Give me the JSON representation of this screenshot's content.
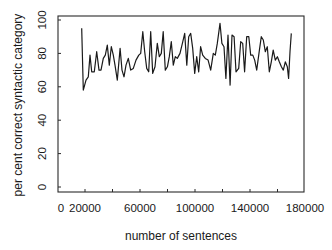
{
  "chart_data": {
    "type": "line",
    "title": "",
    "xlabel": "number of sentences",
    "ylabel": "per cent correct syntactic category",
    "xlim": [
      0,
      180000
    ],
    "ylim": [
      0,
      100
    ],
    "x_ticks": [
      0,
      20000,
      40000,
      60000,
      80000,
      100000,
      120000,
      140000,
      160000,
      180000
    ],
    "x_tick_labels": [
      "0",
      "20000",
      "60000",
      "100000",
      "140000",
      "180000"
    ],
    "x_tick_label_values": [
      0,
      20000,
      60000,
      100000,
      140000,
      180000
    ],
    "y_ticks": [
      0,
      20,
      40,
      60,
      80,
      100
    ],
    "y_tick_labels": [
      "0",
      "20",
      "40",
      "60",
      "80",
      "100"
    ],
    "grid": false,
    "legend": null,
    "line_color": "#1a1a1a",
    "series": [
      {
        "name": "per cent correct",
        "x": [
          17600,
          18800,
          20700,
          22400,
          23600,
          24900,
          26800,
          28500,
          30200,
          31600,
          33300,
          34800,
          36200,
          37700,
          39100,
          40600,
          41800,
          43500,
          45500,
          46900,
          48400,
          49800,
          51500,
          53200,
          55100,
          57100,
          59100,
          60500,
          62000,
          63400,
          64900,
          66300,
          67800,
          69200,
          70900,
          72600,
          74000,
          75500,
          76900,
          78400,
          79900,
          81300,
          82800,
          84200,
          85700,
          87100,
          89100,
          91100,
          92500,
          94000,
          95400,
          96900,
          98300,
          99800,
          101200,
          102700,
          104100,
          105600,
          107500,
          109500,
          111400,
          113300,
          114800,
          116200,
          118200,
          119600,
          121100,
          122500,
          124000,
          125500,
          126900,
          128400,
          129800,
          131800,
          133200,
          134700,
          136100,
          137600,
          139100,
          140500,
          142000,
          143400,
          144900,
          146800,
          148200,
          149700,
          151100,
          152600,
          154000,
          155500,
          156900,
          158400,
          159900,
          161300,
          162800,
          164200,
          165700,
          167100,
          168100,
          169100,
          170000
        ],
        "values": [
          95,
          58,
          64,
          66,
          79,
          69,
          69,
          81,
          70,
          70,
          77,
          79,
          85,
          73,
          84,
          79,
          73,
          64,
          83,
          70,
          66,
          73,
          77,
          70,
          71,
          76,
          79,
          80,
          93,
          81,
          71,
          69,
          93,
          68,
          72,
          86,
          78,
          80,
          93,
          70,
          72,
          78,
          87,
          73,
          78,
          77,
          80,
          87,
          92,
          73,
          90,
          92,
          83,
          68,
          78,
          69,
          84,
          79,
          77,
          76,
          70,
          80,
          79,
          86,
          98,
          86,
          84,
          65,
          91,
          61,
          91,
          90,
          69,
          71,
          87,
          86,
          69,
          90,
          90,
          79,
          79,
          76,
          70,
          82,
          90,
          88,
          81,
          84,
          69,
          75,
          82,
          76,
          78,
          75,
          72,
          70,
          75,
          72,
          65,
          81,
          92
        ]
      }
    ]
  }
}
